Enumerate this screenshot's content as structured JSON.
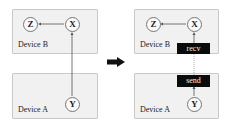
{
  "before": {
    "device_top": {
      "label": "Device B"
    },
    "device_bottom": {
      "label": "Device A"
    },
    "nodes": {
      "z": "Z",
      "x": "X",
      "y": "Y"
    }
  },
  "after": {
    "device_top": {
      "label": "Device B"
    },
    "device_bottom": {
      "label": "Device A"
    },
    "nodes": {
      "z": "Z",
      "x": "X",
      "y": "Y"
    },
    "recv_label": "recv",
    "send_label": "send"
  },
  "transition_arrow": "right-arrow-icon",
  "colors": {
    "device_fill": "#f1f1f1",
    "device_border": "#c9c9c9",
    "tag_fill": "#0b0b0b",
    "tag_text": "#f2f2f2",
    "edge": "#555555"
  }
}
